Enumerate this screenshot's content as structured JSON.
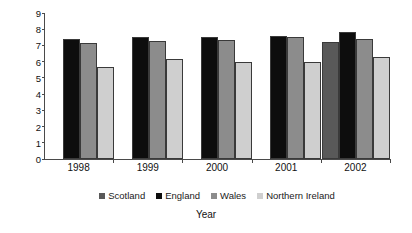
{
  "chart_data": {
    "type": "bar",
    "title": "",
    "xlabel": "Year",
    "ylabel": "% low birth weight live births",
    "categories": [
      "1998",
      "1999",
      "2000",
      "2001",
      "2002"
    ],
    "ylim": [
      0,
      9
    ],
    "yticks": [
      "0",
      "1",
      "2",
      "3",
      "4",
      "5",
      "6",
      "7",
      "8",
      "9"
    ],
    "grid": false,
    "legend_position": "bottom",
    "series": [
      {
        "name": "Scotland",
        "color": "#595959",
        "values": [
          null,
          null,
          null,
          null,
          7.2
        ]
      },
      {
        "name": "England",
        "color": "#0d0d0d",
        "values": [
          7.4,
          7.55,
          7.5,
          7.6,
          7.8
        ]
      },
      {
        "name": "Wales",
        "color": "#8c8c8c",
        "values": [
          7.15,
          7.25,
          7.35,
          7.5,
          7.4
        ]
      },
      {
        "name": "Northern Ireland",
        "color": "#cfcfcf",
        "values": [
          5.65,
          6.15,
          5.95,
          6.0,
          6.3
        ]
      }
    ]
  }
}
